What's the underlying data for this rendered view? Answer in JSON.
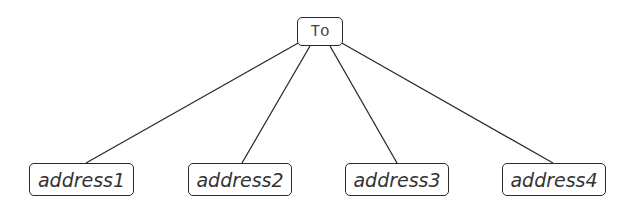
{
  "diagram": {
    "type": "tree",
    "root": {
      "label": "To"
    },
    "children": [
      {
        "label": "address1"
      },
      {
        "label": "address2"
      },
      {
        "label": "address3"
      },
      {
        "label": "address4"
      }
    ],
    "edges": [
      {
        "from": "To",
        "to": "address1"
      },
      {
        "from": "To",
        "to": "address2"
      },
      {
        "from": "To",
        "to": "address3"
      },
      {
        "from": "To",
        "to": "address4"
      }
    ],
    "colors": {
      "stroke": "#2a2a2a",
      "text": "#333333",
      "background": "#ffffff"
    }
  }
}
